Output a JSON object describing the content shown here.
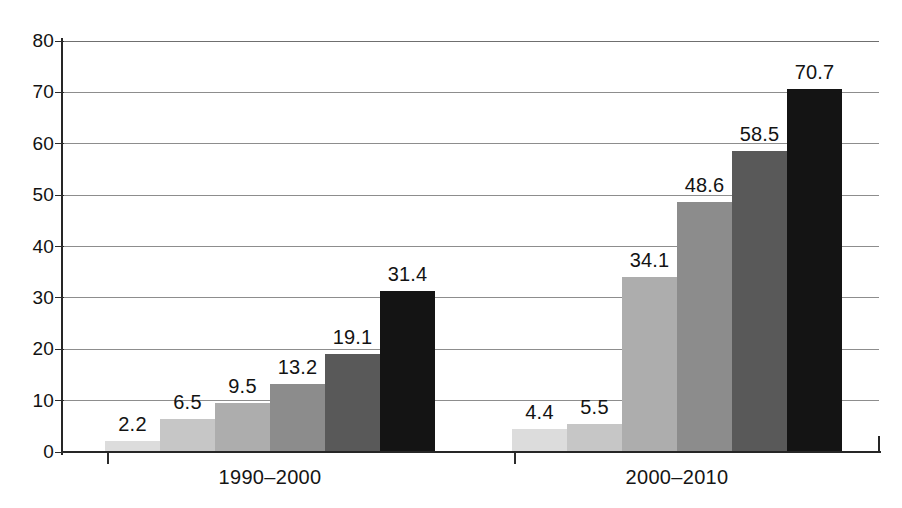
{
  "chart_data": {
    "type": "bar",
    "title": "",
    "subtitle": "",
    "xlabel": "",
    "ylabel": "",
    "ylim": [
      0,
      80
    ],
    "ytick_step": 10,
    "yticks": [
      "0",
      "10",
      "20",
      "30",
      "40",
      "50",
      "60",
      "70",
      "80"
    ],
    "grid": true,
    "legend": false,
    "legend_position": "none",
    "categories": [
      "1990–2000",
      "2000–2010"
    ],
    "groups": [
      {
        "category": "1990–2000",
        "values": [
          2.2,
          6.5,
          9.5,
          13.2,
          19.1,
          31.4
        ],
        "labels": [
          "2.2",
          "6.5",
          "9.5",
          "13.2",
          "19.1",
          "31.4"
        ]
      },
      {
        "category": "2000–2010",
        "values": [
          4.4,
          5.5,
          34.1,
          48.6,
          58.5,
          70.7
        ],
        "labels": [
          "4.4",
          "5.5",
          "34.1",
          "48.6",
          "58.5",
          "70.7"
        ]
      }
    ],
    "series": [
      {
        "name": "series-1",
        "values": [
          2.2,
          4.4
        ],
        "color": "#dcdcdc"
      },
      {
        "name": "series-2",
        "values": [
          6.5,
          5.5
        ],
        "color": "#c6c6c6"
      },
      {
        "name": "series-3",
        "values": [
          9.5,
          34.1
        ],
        "color": "#adadad"
      },
      {
        "name": "series-4",
        "values": [
          13.2,
          48.6
        ],
        "color": "#8c8c8c"
      },
      {
        "name": "series-5",
        "values": [
          19.1,
          58.5
        ],
        "color": "#595959"
      },
      {
        "name": "series-6",
        "values": [
          31.4,
          70.7
        ],
        "color": "#141414"
      }
    ],
    "colors": {
      "axis": "#262626",
      "gridline": "#8d8d8d",
      "text": "#131313",
      "background": "#ffffff"
    }
  }
}
